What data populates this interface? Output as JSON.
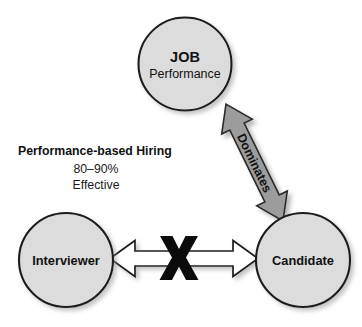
{
  "diagram": {
    "background_color": "#ffffff",
    "nodes": [
      {
        "id": "job",
        "title": "JOB",
        "subtitle": "Performance",
        "cx": 185,
        "cy": 64,
        "r": 46.5,
        "fill": "#dcdcdc",
        "stroke": "#1d1d1d"
      },
      {
        "id": "interviewer",
        "title": "Interviewer",
        "cx": 66,
        "cy": 260,
        "r": 47,
        "fill": "#dcdcdc",
        "stroke": "#1d1d1d"
      },
      {
        "id": "candidate",
        "title": "Candidate",
        "cx": 303,
        "cy": 260,
        "r": 47,
        "fill": "#dcdcdc",
        "stroke": "#1d1d1d"
      }
    ],
    "connectors": [
      {
        "id": "dominates-arrow",
        "label": "Dominates",
        "style": "filled-gray-double-arrow",
        "fill": "#9c9c9c",
        "from": "job",
        "to": "candidate"
      },
      {
        "id": "interviewer-candidate-arrow",
        "label": "",
        "style": "hollow-white-double-arrow",
        "fill": "#ffffff",
        "from": "interviewer",
        "to": "candidate",
        "overlay": "X",
        "overlay_meaning": "blocked-relationship"
      }
    ],
    "caption": {
      "title": "Performance-based Hiring",
      "line1": "80–90%",
      "line2": "Effective"
    }
  }
}
